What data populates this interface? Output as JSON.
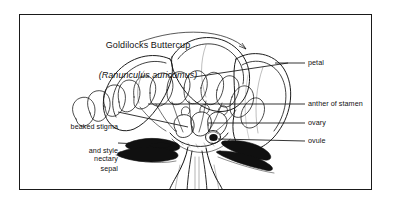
{
  "plate": {
    "title": {
      "common_name": "Goldilocks Buttercup",
      "scientific_name": "(Ranunculus auricomus)"
    },
    "caption": {
      "line1": "Simple",
      "line2": "dicotyledon"
    },
    "labels_left": [
      {
        "id": "beaked-stigma",
        "line1": "beaked stigma",
        "line2": "and style"
      },
      {
        "id": "nectary",
        "line1": "nectary",
        "line2": ""
      },
      {
        "id": "sepal",
        "line1": "sepal",
        "line2": ""
      }
    ],
    "labels_right": [
      {
        "id": "petal",
        "text": "petal"
      },
      {
        "id": "anther-of-stamen",
        "text": "anther of stamen"
      },
      {
        "id": "ovary",
        "text": "ovary"
      },
      {
        "id": "ovule",
        "text": "ovule"
      }
    ],
    "colors": {
      "ink": "#111111",
      "border": "#1a1a1a",
      "paper": "#ffffff",
      "fill_dark": "#101010"
    }
  }
}
